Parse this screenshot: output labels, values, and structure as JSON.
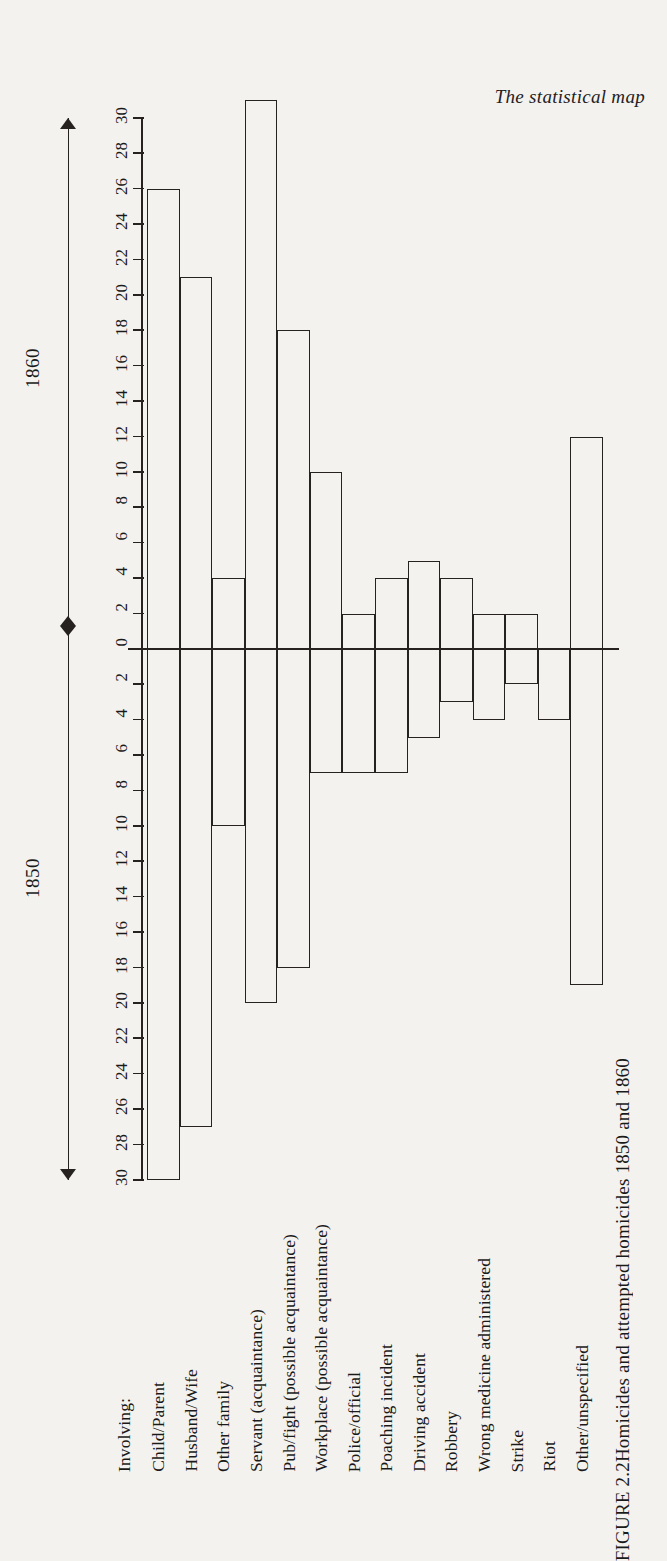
{
  "page": {
    "running_head": "The statistical map",
    "caption_label": "FIGURE 2.2",
    "caption_text": "Homicides and attempted homicides 1850 and 1860",
    "category_header": "Involving:"
  },
  "year_axis": {
    "upper_label": "1860",
    "lower_label": "1850"
  },
  "chart_data": {
    "type": "bar",
    "title": "Homicides and attempted homicides 1850 and 1860",
    "orientation": "rotated-vertical-diverging",
    "xlabel": "Involving:",
    "ylabel": "",
    "ylim": [
      -30,
      30
    ],
    "grid": false,
    "legend_position": "axis-brackets",
    "tick_labels_positive": [
      "0",
      "2",
      "4",
      "6",
      "8",
      "10",
      "12",
      "14",
      "16",
      "18",
      "20",
      "22",
      "24",
      "26",
      "28",
      "30"
    ],
    "tick_labels_negative": [
      "2",
      "4",
      "6",
      "8",
      "10",
      "12",
      "14",
      "16",
      "18",
      "20",
      "22",
      "24",
      "26",
      "28",
      "30"
    ],
    "categories": [
      "Child/Parent",
      "Husband/Wife",
      "Other family",
      "Servant (acquaintance)",
      "Pub/fight (possible acquaintance)",
      "Workplace (possible acquaintance)",
      "Police/official",
      "Poaching incident",
      "Driving accident",
      "Robbery",
      "Wrong medicine administered",
      "Strike",
      "Riot",
      "Other/unspecified"
    ],
    "series": [
      {
        "name": "1860",
        "direction": "positive",
        "values": [
          26,
          21,
          4,
          31,
          18,
          10,
          2,
          4,
          5,
          4,
          2,
          2,
          0,
          12
        ]
      },
      {
        "name": "1850",
        "direction": "negative",
        "values": [
          30,
          27,
          10,
          20,
          18,
          7,
          7,
          7,
          5,
          3,
          4,
          2,
          4,
          19
        ]
      }
    ]
  },
  "colors": {
    "ink": "#262220",
    "paper": "#f4f2ee"
  }
}
